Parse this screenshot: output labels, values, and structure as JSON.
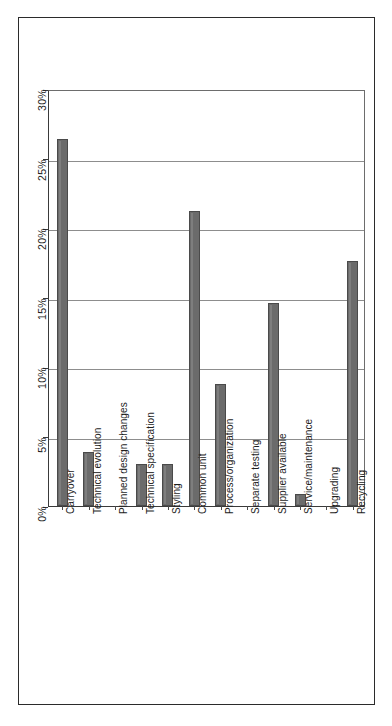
{
  "chart_data": {
    "type": "bar",
    "title": "",
    "subtitle": "",
    "xlabel": "",
    "ylabel": "",
    "ylim": [
      0,
      30
    ],
    "yunit": "%",
    "grid": true,
    "legend": false,
    "orientation": "vertical",
    "categories": [
      "Carryover",
      "Technical evolution",
      "Planned design changes",
      "Technical specification",
      "Styling",
      "Common unit",
      "Process/organization",
      "Separate testing",
      "Supplier available",
      "Service/maintenance",
      "Upgrading",
      "Recycling"
    ],
    "values": [
      26.4,
      3.9,
      0,
      3.0,
      3.0,
      21.2,
      8.8,
      0,
      14.6,
      0.9,
      0,
      17.6
    ],
    "ytick_labels": [
      "0%",
      "5%",
      "10%",
      "15%",
      "20%",
      "25%",
      "30%"
    ],
    "ytick_values": [
      0,
      5,
      10,
      15,
      20,
      25,
      30
    ],
    "bar_color": "#6b6b6b",
    "grid_color": "#8d8d8d",
    "axis_color": "#3a3a3a",
    "frame_color": "#2b2b2b"
  }
}
